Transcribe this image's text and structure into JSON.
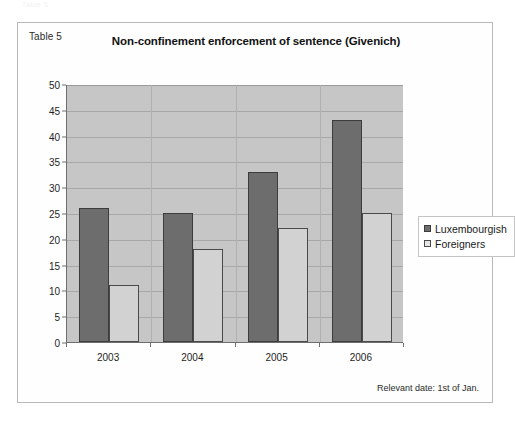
{
  "scan_artifact_text": "Table 5",
  "figure": {
    "table_label": "Table 5",
    "footnote": "Relevant date: 1st of Jan."
  },
  "chart_data": {
    "type": "bar",
    "title": "Non-confinement enforcement of sentence (Givenich)",
    "xlabel": "",
    "ylabel": "",
    "categories": [
      "2003",
      "2004",
      "2005",
      "2006"
    ],
    "series": [
      {
        "name": "Luxembourgish",
        "color": "#6d6d6d",
        "values": [
          26,
          25,
          33,
          43
        ]
      },
      {
        "name": "Foreigners",
        "color": "#d2d2d2",
        "values": [
          11,
          18,
          22,
          25
        ]
      }
    ],
    "ylim": [
      0,
      50
    ],
    "ytick_step": 5,
    "yticks": [
      0,
      5,
      10,
      15,
      20,
      25,
      30,
      35,
      40,
      45,
      50
    ],
    "grid": true,
    "legend_position": "right",
    "plot_background": "#c6c6c6"
  }
}
